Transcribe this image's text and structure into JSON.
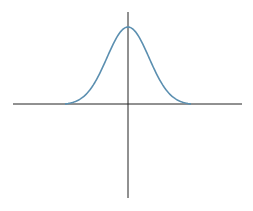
{
  "chart_data": {
    "type": "line",
    "title": "",
    "xlabel": "",
    "ylabel": "",
    "series": [
      {
        "name": "gaussian",
        "function": "exp(-x^2/2)",
        "x": [
          -3,
          -2.5,
          -2,
          -1.5,
          -1,
          -0.5,
          0,
          0.5,
          1,
          1.5,
          2,
          2.5,
          3
        ],
        "values": [
          0.011,
          0.044,
          0.135,
          0.325,
          0.607,
          0.882,
          1.0,
          0.882,
          0.607,
          0.325,
          0.135,
          0.044,
          0.011
        ]
      }
    ],
    "xlim": [
      -4.5,
      4.5
    ],
    "ylim": [
      -1.2,
      1.2
    ],
    "grid": false,
    "legend": null,
    "colors": {
      "curve": "#5b8fb0",
      "axes": "#222222"
    }
  }
}
